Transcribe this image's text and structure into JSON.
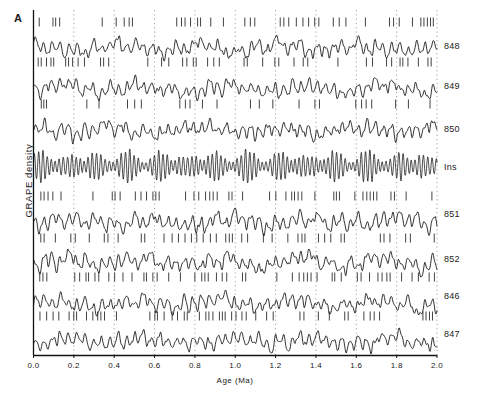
{
  "figure": {
    "panel_label": "A",
    "ylabel": "GRAPE density",
    "xlabel": "Age  (Ma)"
  },
  "chart_data": {
    "type": "line",
    "title": "",
    "xlabel": "Age  (Ma)",
    "ylabel": "GRAPE density",
    "xlim": [
      0.0,
      2.0
    ],
    "xticks": [
      0.0,
      0.2,
      0.4,
      0.6,
      0.8,
      1.0,
      1.2,
      1.4,
      1.6,
      1.8,
      2.0
    ],
    "xtick_labels": [
      "0.0",
      "0.2",
      "0.4",
      "0.6",
      "0.8",
      "1.0",
      "1.2",
      "1.4",
      "1.6",
      "1.8",
      "2.0"
    ],
    "grid": "vertical dotted gridlines at every x tick",
    "legend": "none; series labelled at right edge",
    "legend_position": "right",
    "yaxis": "unlabelled stacked offset traces (arbitrary units)",
    "series": [
      {
        "name": "848",
        "label": "848",
        "kind": "grape-density",
        "has_tickmarks": true
      },
      {
        "name": "849",
        "label": "849",
        "kind": "grape-density",
        "has_tickmarks": true
      },
      {
        "name": "850",
        "label": "850",
        "kind": "grape-density",
        "has_tickmarks": true
      },
      {
        "name": "Ins",
        "label": "Ins",
        "kind": "insolation",
        "has_tickmarks": false
      },
      {
        "name": "851",
        "label": "851",
        "kind": "grape-density",
        "has_tickmarks": true
      },
      {
        "name": "852",
        "label": "852",
        "kind": "grape-density",
        "has_tickmarks": true
      },
      {
        "name": "846",
        "label": "846",
        "kind": "grape-density",
        "has_tickmarks": true
      },
      {
        "name": "847",
        "label": "847",
        "kind": "grape-density",
        "has_tickmarks": true
      }
    ],
    "colors": {
      "trace": "#111111",
      "gridline": "#8a8a8a",
      "axis": "#111111"
    }
  },
  "rows": [
    {
      "label": "848"
    },
    {
      "label": "849"
    },
    {
      "label": "850"
    },
    {
      "label": "Ins"
    },
    {
      "label": "851"
    },
    {
      "label": "852"
    },
    {
      "label": "846"
    },
    {
      "label": "847"
    }
  ],
  "xticks": [
    {
      "label": "0.0"
    },
    {
      "label": "0.2"
    },
    {
      "label": "0.4"
    },
    {
      "label": "0.6"
    },
    {
      "label": "0.8"
    },
    {
      "label": "1.0"
    },
    {
      "label": "1.2"
    },
    {
      "label": "1.4"
    },
    {
      "label": "1.6"
    },
    {
      "label": "1.8"
    },
    {
      "label": "2.0"
    }
  ]
}
